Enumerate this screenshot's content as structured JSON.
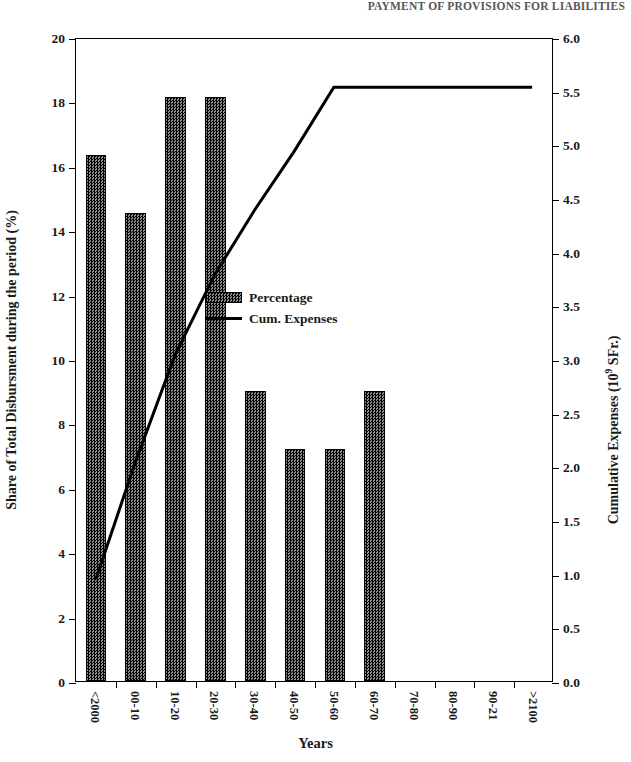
{
  "page_header": {
    "text": "PAYMENT OF PROVISIONS FOR LIABILITIES"
  },
  "chart_data": {
    "type": "bar",
    "title": "",
    "subtitle": "",
    "xlabel": "Years",
    "ylabel": "Share of Total Disbursment during the period (%)",
    "y2label": "Cumulative Expenses (10⁹ SFr.)",
    "y2label_base": "Cumulative Expenses (10",
    "y2label_exp": "9",
    "y2label_tail": " SFr.)",
    "grid": false,
    "legend_position": "center",
    "categories": [
      "<2000",
      "00-10",
      "10-20",
      "20-30",
      "30-40",
      "40-50",
      "50-60",
      "60-70",
      "70-80",
      "80-90",
      "90-21",
      ">2100"
    ],
    "ylim": [
      0,
      20
    ],
    "yticks": [
      0,
      2,
      4,
      6,
      8,
      10,
      12,
      14,
      16,
      18,
      20
    ],
    "ytick_labels": [
      "0",
      "2",
      "4",
      "6",
      "8",
      "10",
      "12",
      "14",
      "16",
      "18",
      "20"
    ],
    "y2lim": [
      0.0,
      6.0
    ],
    "y2ticks": [
      0.0,
      0.5,
      1.0,
      1.5,
      2.0,
      2.5,
      3.0,
      3.5,
      4.0,
      4.5,
      5.0,
      5.5,
      6.0
    ],
    "y2tick_labels": [
      "0.0",
      "0.5",
      "1.0",
      "1.5",
      "2.0",
      "2.5",
      "3.0",
      "3.5",
      "4.0",
      "4.5",
      "5.0",
      "5.5",
      "6.0"
    ],
    "series": [
      {
        "name": "Percentage",
        "type": "bar",
        "axis": "left",
        "color": "#4d4d4d",
        "values": [
          16.35,
          14.55,
          18.15,
          18.15,
          9.0,
          7.2,
          7.2,
          9.0,
          0,
          0,
          0,
          0
        ]
      },
      {
        "name": "Cum. Expenses",
        "type": "line",
        "axis": "right",
        "color": "#000000",
        "values": [
          0.95,
          2.05,
          3.05,
          3.8,
          4.4,
          4.95,
          5.55,
          5.55,
          5.55,
          5.55,
          5.55,
          5.55
        ]
      }
    ]
  },
  "legend": {
    "items": [
      {
        "label": "Percentage",
        "marker": "bar-swatch"
      },
      {
        "label": "Cum. Expenses",
        "marker": "line-swatch"
      }
    ]
  }
}
